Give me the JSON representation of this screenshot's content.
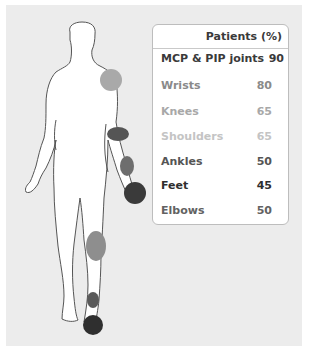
{
  "table": {
    "header": "Patients (%)",
    "rows": [
      {
        "label": "MCP & PIP joints",
        "value": "90",
        "color": "#3a3a3a"
      },
      {
        "label": "Wrists",
        "value": "80",
        "color": "#8a8a8a"
      },
      {
        "label": "Knees",
        "value": "65",
        "color": "#a8a8a8"
      },
      {
        "label": "Shoulders",
        "value": "65",
        "color": "#c4c4c4"
      },
      {
        "label": "Ankles",
        "value": "50",
        "color": "#555555"
      },
      {
        "label": "Feet",
        "value": "45",
        "color": "#2e2e2e"
      },
      {
        "label": "Elbows",
        "value": "50",
        "color": "#626262"
      }
    ]
  },
  "markers": {
    "shoulder": {
      "color": "#a9a9a9",
      "joint": "Shoulders"
    },
    "elbow": {
      "color": "#555555",
      "joint": "Elbows"
    },
    "wrist": {
      "color": "#6e6e6e",
      "joint": "Wrists"
    },
    "hand": {
      "color": "#3a3a3a",
      "joint": "MCP & PIP joints"
    },
    "knee": {
      "color": "#8e8e8e",
      "joint": "Knees"
    },
    "ankle": {
      "color": "#5a5a5a",
      "joint": "Ankles"
    },
    "foot": {
      "color": "#2f2f2f",
      "joint": "Feet"
    }
  }
}
